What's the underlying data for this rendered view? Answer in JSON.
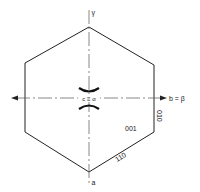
{
  "diagram": {
    "type": "crystal-habit-projection",
    "shape": "hexagon",
    "colors": {
      "line": "#222222",
      "axis": "#555555",
      "background": "#ffffff"
    },
    "axes": {
      "vertical_top_label": "γ",
      "vertical_bottom_label": "a",
      "horizontal_right_label": "b = β",
      "center_label": "c ≡ α"
    },
    "faces": {
      "center_face": "001",
      "right_edge_face": "010",
      "lower_right_edge_face": "110"
    }
  }
}
